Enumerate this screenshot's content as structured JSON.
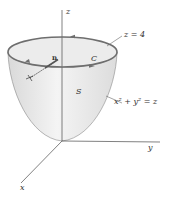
{
  "figure": {
    "type": "3d-surface-diagram",
    "axes": {
      "x_label": "x",
      "y_label": "y",
      "z_label": "z"
    },
    "surface": {
      "label": "S",
      "equation_lhs_x": "x",
      "equation_lhs_y": "y",
      "exp": "2",
      "equation": "x² + y² = z"
    },
    "boundary_curve": {
      "label": "C",
      "plane": "z = 4"
    },
    "normal_vector": {
      "label": "n"
    },
    "colors": {
      "surface_fill": "#e6e6e6",
      "rim": "#6e6e6e",
      "axis": "#4a4a4a",
      "text": "#333333"
    }
  }
}
